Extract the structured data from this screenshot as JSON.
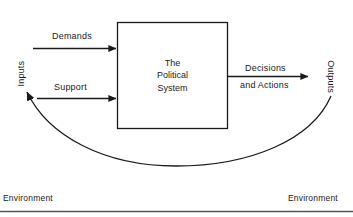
{
  "diagram": {
    "title": "The Political System",
    "type": "systems-flow-diagram",
    "stroke_color": "#1a1a1a",
    "background_color": "#ffffff",
    "central_box": {
      "name": "political-system-box",
      "line_1": "The",
      "line_2": "Political",
      "line_3": "System"
    },
    "inputs": {
      "axis_label": "Inputs",
      "flows": [
        {
          "label": "Demands",
          "direction": "into-system"
        },
        {
          "label": "Support",
          "direction": "into-system"
        }
      ]
    },
    "outputs": {
      "axis_label": "Outputs",
      "flows": [
        {
          "label_line_1": "Decisions",
          "label_line_2": "and Actions",
          "direction": "out-of-system"
        }
      ]
    },
    "feedback": {
      "name": "feedback-loop",
      "description": "curved arrow from Outputs back to Inputs"
    },
    "environment": {
      "label_left": "Environment",
      "label_right": "Environment"
    }
  }
}
